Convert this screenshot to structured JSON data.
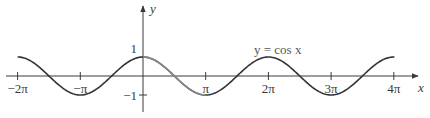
{
  "chart_data": {
    "type": "line",
    "title": "",
    "xlabel": "x",
    "ylabel": "y",
    "annotation": "y = cos x",
    "xlim": [
      -6.283,
      12.566
    ],
    "ylim": [
      -1,
      1
    ],
    "grid": false,
    "legend": null,
    "x_ticks": [
      {
        "value": -6.2832,
        "label": "−2π"
      },
      {
        "value": -3.1416,
        "label": "−π"
      },
      {
        "value": 3.1416,
        "label": "π"
      },
      {
        "value": 6.2832,
        "label": "2π"
      },
      {
        "value": 9.4248,
        "label": "3π"
      },
      {
        "value": 12.5664,
        "label": "4π"
      }
    ],
    "y_ticks": [
      {
        "value": 1,
        "label": "1"
      },
      {
        "value": -1,
        "label": "−1"
      }
    ],
    "series": [
      {
        "name": "y = cos x",
        "function": "cos",
        "x_range": [
          -6.2832,
          12.6
        ],
        "x": [
          -6.2832,
          -4.7124,
          -3.1416,
          -1.5708,
          0,
          1.5708,
          3.1416,
          4.7124,
          6.2832,
          7.854,
          9.4248,
          10.9956,
          12.5664
        ],
        "values": [
          1,
          0,
          -1,
          0,
          1,
          0,
          -1,
          0,
          1,
          0,
          -1,
          0,
          1
        ],
        "color": "#333333",
        "highlight_segment": {
          "x_range": [
            0,
            3.1416
          ],
          "color": "#8a8a8a"
        }
      }
    ]
  },
  "colors": {
    "axis": "#3a3a3a",
    "curve": "#333333",
    "curve_highlight": "#8a8a8a",
    "label": "#3a3a3a"
  },
  "labels": {
    "x_axis": "x",
    "y_axis": "y",
    "function": "y = cos x",
    "tick_x": [
      "−2π",
      "−π",
      "π",
      "2π",
      "3π",
      "4π"
    ],
    "tick_y": [
      "1",
      "−1"
    ]
  }
}
